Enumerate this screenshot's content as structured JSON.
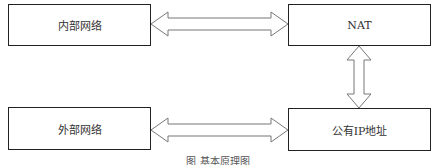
{
  "diagram": {
    "nodes": [
      {
        "id": "internal",
        "label": "内部网络"
      },
      {
        "id": "nat",
        "label": "NAT"
      },
      {
        "id": "external",
        "label": "外部网络"
      },
      {
        "id": "publicip",
        "label": "公有IP地址"
      }
    ],
    "edges": [
      {
        "from": "internal",
        "to": "nat",
        "type": "bidirectional"
      },
      {
        "from": "nat",
        "to": "publicip",
        "type": "bidirectional"
      },
      {
        "from": "external",
        "to": "publicip",
        "type": "bidirectional"
      }
    ],
    "caption": "图      基本原理图",
    "colors": {
      "stroke": "#222222",
      "arrow_stroke": "#777777",
      "background": "#ffffff"
    }
  }
}
